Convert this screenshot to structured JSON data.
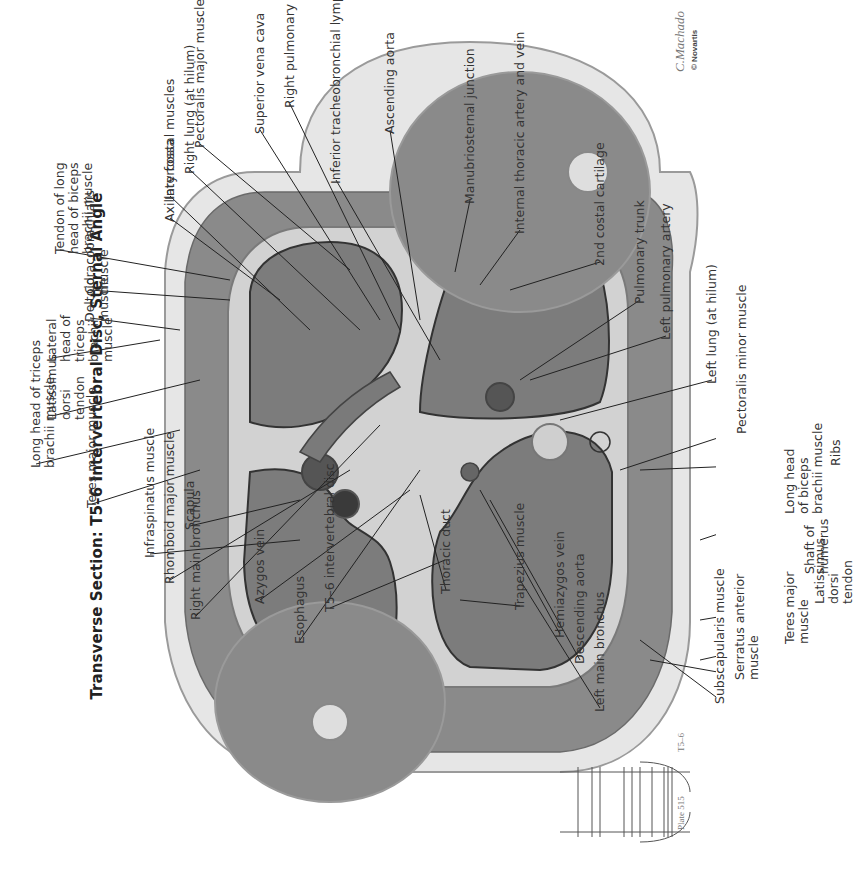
{
  "title": "Transverse Section: T5–6 Intervertebral Disc, Sternal Angle",
  "plate": {
    "label": "Plate 515",
    "level": "T5–6"
  },
  "signature": "C.Machado",
  "copyright": "© Novartis",
  "colors": {
    "tissue_dark": "#6f6f6f",
    "tissue_mid": "#8c8c8c",
    "fat": "#e4e4e4",
    "skin": "#d8d8d8",
    "lung": "#7d7d7d",
    "line": "#222222"
  },
  "labels": [
    {
      "id": "inferior-tracheobronchial-lymph-nodes",
      "text": "Inferior tracheobronchial lymph nodes",
      "x": 336,
      "y": 180,
      "tx": 440,
      "ty": 360
    },
    {
      "id": "manubriosternal-junction",
      "text": "Manubriosternal junction",
      "x": 470,
      "y": 200,
      "tx": 455,
      "ty": 272
    },
    {
      "id": "internal-thoracic-artery-and-vein",
      "text": "Internal thoracic artery and vein",
      "x": 520,
      "y": 230,
      "tx": 480,
      "ty": 285
    },
    {
      "id": "2nd-costal-cartilage",
      "text": "2nd costal cartilage",
      "x": 600,
      "y": 262,
      "tx": 510,
      "ty": 290
    },
    {
      "id": "pulmonary-trunk",
      "text": "Pulmonary trunk",
      "x": 640,
      "y": 300,
      "tx": 520,
      "ty": 380
    },
    {
      "id": "left-pulmonary-artery",
      "text": "Left pulmonary artery",
      "x": 666,
      "y": 336,
      "tx": 530,
      "ty": 380
    },
    {
      "id": "left-lung-at-hilum",
      "text": "Left lung (at hilum)",
      "x": 712,
      "y": 380,
      "tx": 560,
      "ty": 420
    },
    {
      "id": "pectoralis-minor-muscle",
      "text": "Pectoralis minor muscle",
      "x": 742,
      "y": 430,
      "tx": 620,
      "ty": 470
    },
    {
      "id": "ribs",
      "text": "Ribs",
      "x": 836,
      "y": 462,
      "tx": 640,
      "ty": 470
    },
    {
      "id": "long-head-of-biceps-brachii-muscle",
      "text": "Long head\nof biceps\nbrachii muscle",
      "x": 790,
      "y": 510,
      "tx": 700,
      "ty": 540
    },
    {
      "id": "shaft-of-humerus",
      "text": "Shaft of\nhumerus",
      "x": 810,
      "y": 570,
      "tx": 720,
      "ty": 588
    },
    {
      "id": "latissimus-dorsi-tendon-top",
      "text": "Latissimus\ndorsi\ntendon",
      "x": 820,
      "y": 600,
      "tx": 700,
      "ty": 620
    },
    {
      "id": "teres-major-muscle-top",
      "text": "Teres major\nmuscle",
      "x": 790,
      "y": 640,
      "tx": 700,
      "ty": 660
    },
    {
      "id": "serratus-anterior-muscle",
      "text": "Serratus anterior\nmuscle",
      "x": 740,
      "y": 676,
      "tx": 650,
      "ty": 660
    },
    {
      "id": "subscapularis-muscle",
      "text": "Subscapularis muscle",
      "x": 720,
      "y": 700,
      "tx": 640,
      "ty": 640
    },
    {
      "id": "left-main-bronchus",
      "text": "Left main bronchus",
      "x": 600,
      "y": 708,
      "tx": 520,
      "ty": 580
    },
    {
      "id": "descending-aorta",
      "text": "Descending aorta",
      "x": 580,
      "y": 660,
      "tx": 490,
      "ty": 500
    },
    {
      "id": "hemiazygos-vein",
      "text": "Hemiazygos vein",
      "x": 560,
      "y": 634,
      "tx": 480,
      "ty": 490
    },
    {
      "id": "trapezius-muscle",
      "text": "Trapezius muscle",
      "x": 520,
      "y": 606,
      "tx": 460,
      "ty": 600
    },
    {
      "id": "thoracic-duct",
      "text": "Thoracic duct",
      "x": 446,
      "y": 590,
      "tx": 420,
      "ty": 495
    },
    {
      "id": "t5-6-intervertebral-disc",
      "text": "T5–6 intervertebral disc",
      "x": 330,
      "y": 608,
      "tx": 445,
      "ty": 560
    },
    {
      "id": "esophagus",
      "text": "Esophagus",
      "x": 300,
      "y": 640,
      "tx": 420,
      "ty": 470
    },
    {
      "id": "azygos-vein",
      "text": "Azygos vein",
      "x": 260,
      "y": 600,
      "tx": 410,
      "ty": 490
    },
    {
      "id": "right-main-bronchus",
      "text": "Right main bronchus",
      "x": 196,
      "y": 616,
      "tx": 380,
      "ty": 425
    },
    {
      "id": "rhomboid-major-muscle",
      "text": "Rhomboid major muscle",
      "x": 170,
      "y": 580,
      "tx": 350,
      "ty": 470
    },
    {
      "id": "infraspinatus-muscle",
      "text": "Infraspinatus muscle",
      "x": 150,
      "y": 554,
      "tx": 300,
      "ty": 540
    },
    {
      "id": "scapula",
      "text": "Scapula",
      "x": 190,
      "y": 526,
      "tx": 300,
      "ty": 500
    },
    {
      "id": "teres-major-muscle-bottom",
      "text": "Teres major muscle",
      "x": 92,
      "y": 504,
      "tx": 200,
      "ty": 470
    },
    {
      "id": "long-head-of-triceps-brachii-muscle",
      "text": "Long head of triceps\nbrachii muscle",
      "x": 36,
      "y": 464,
      "tx": 180,
      "ty": 430
    },
    {
      "id": "latissimus-dorsi-tendon-bottom",
      "text": "Latissimus\ndorsi\ntendon",
      "x": 52,
      "y": 416,
      "tx": 200,
      "ty": 380
    },
    {
      "id": "lateral-head-of-triceps-brachii-muscle",
      "text": "Lateral\nhead of\ntriceps\nbrachii\nmuscle",
      "x": 52,
      "y": 358,
      "tx": 160,
      "ty": 340
    },
    {
      "id": "deltoid-muscle",
      "text": "Deltoid\nmuscle",
      "x": 90,
      "y": 318,
      "tx": 180,
      "ty": 330
    },
    {
      "id": "coracobrachialis-muscle",
      "text": "Coracobrachialis\nmuscle",
      "x": 90,
      "y": 290,
      "tx": 230,
      "ty": 300
    },
    {
      "id": "tendon-of-long-head-of-biceps-brachii-muscle",
      "text": "Tendon of long\nhead of biceps\nbrachii muscle",
      "x": 60,
      "y": 250,
      "tx": 230,
      "ty": 280
    },
    {
      "id": "axillary-fossa",
      "text": "Axillary fossa",
      "x": 170,
      "y": 218,
      "tx": 280,
      "ty": 300
    },
    {
      "id": "intercostal-muscles",
      "text": "Intercostal muscles",
      "x": 170,
      "y": 196,
      "tx": 310,
      "ty": 330
    },
    {
      "id": "right-lung-at-hilum",
      "text": "Right lung (at hilum)",
      "x": 190,
      "y": 170,
      "tx": 360,
      "ty": 330
    },
    {
      "id": "pectoralis-major-muscle",
      "text": "Pectoralis major muscle",
      "x": 200,
      "y": 144,
      "tx": 350,
      "ty": 270
    },
    {
      "id": "superior-vena-cava",
      "text": "Superior vena cava",
      "x": 260,
      "y": 130,
      "tx": 380,
      "ty": 320
    },
    {
      "id": "right-pulmonary-artery",
      "text": "Right pulmonary artery",
      "x": 290,
      "y": 104,
      "tx": 400,
      "ty": 330
    },
    {
      "id": "ascending-aorta",
      "text": "Ascending aorta",
      "x": 390,
      "y": 130,
      "tx": 420,
      "ty": 320
    }
  ]
}
